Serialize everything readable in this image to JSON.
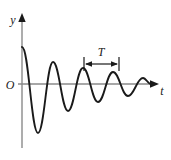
{
  "figure": {
    "background_color": "#ffffff",
    "curve_color": "#1a1a1a",
    "axis_color": "#8a8a8a",
    "label_color": "#1a1a1a"
  },
  "labels": {
    "y_axis": "y",
    "x_axis": "t",
    "origin": "O",
    "period": "T"
  },
  "chart_data": {
    "type": "line",
    "title": "",
    "xlabel": "t",
    "ylabel": "y",
    "grid": false,
    "legend": null,
    "annotations": [
      {
        "text": "T",
        "kind": "dimension-span",
        "description": "double-headed arrow marking one period between two successive peaks",
        "x_start": 84,
        "x_end": 119,
        "y": 64
      }
    ],
    "axes": {
      "x_axis_y_px": 84,
      "y_axis_x_px": 22,
      "x_axis_start_px": 22,
      "x_axis_end_px": 158,
      "y_axis_top_px": 16,
      "y_axis_bottom_px": 148
    },
    "model": {
      "description": "exponentially damped cosine, y = A0 * exp(-t/tau) * cos(2*pi*t/T)",
      "amplitude_initial": 1.0,
      "period": 30,
      "decay_constant_tau": 52,
      "phase": 0
    },
    "series": [
      {
        "name": "damped oscillation",
        "x": [
          0,
          7.5,
          15,
          22.5,
          30,
          37.5,
          45,
          52.5,
          60,
          67.5,
          75,
          82.5,
          90,
          97.5,
          105,
          112.5,
          120,
          127.5,
          135
        ],
        "y": [
          1.0,
          0.0,
          -0.749,
          0.0,
          0.562,
          0.0,
          -0.421,
          0.0,
          0.316,
          0.0,
          -0.237,
          0.0,
          0.177,
          0.0,
          -0.133,
          0.0,
          0.1,
          0.0,
          -0.075
        ]
      }
    ],
    "extrema_px": [
      {
        "kind": "start",
        "x": 22,
        "y": 47
      },
      {
        "kind": "trough",
        "x": 38,
        "y": 133
      },
      {
        "kind": "peak",
        "x": 53,
        "y": 62
      },
      {
        "kind": "trough",
        "x": 68,
        "y": 111
      },
      {
        "kind": "peak",
        "x": 83,
        "y": 68
      },
      {
        "kind": "trough",
        "x": 98,
        "y": 102
      },
      {
        "kind": "peak",
        "x": 113,
        "y": 72
      },
      {
        "kind": "trough",
        "x": 128,
        "y": 96
      },
      {
        "kind": "peak",
        "x": 143,
        "y": 78
      }
    ]
  }
}
